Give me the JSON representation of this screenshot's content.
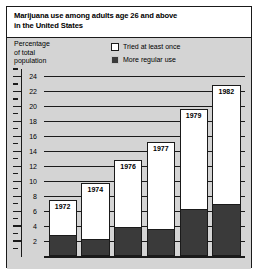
{
  "title": {
    "line1": "Marijuana use among adults age 26 and above",
    "line2": "in the United States"
  },
  "ylabel": {
    "line1": "Percentage",
    "line2": "of total",
    "line3": "population"
  },
  "legend": [
    {
      "label": "Tried at least once",
      "swatch": "open-square-icon",
      "color": "#ffffff"
    },
    {
      "label": "More regular use",
      "swatch": "filled-square-icon",
      "color": "#3a3a3a"
    }
  ],
  "chart_data": {
    "type": "bar",
    "title": "Marijuana use among adults age 26 and above in the United States",
    "xlabel": "",
    "ylabel": "Percentage of total population",
    "ylim": [
      0,
      25
    ],
    "yticks": [
      2,
      4,
      6,
      8,
      10,
      12,
      14,
      16,
      18,
      20,
      22,
      24
    ],
    "minor_tick_step": 1,
    "grid": true,
    "legend_position": "top-right",
    "categories": [
      "1972",
      "1974",
      "1976",
      "1977",
      "1979",
      "1982"
    ],
    "series": [
      {
        "name": "Tried at least once",
        "values": [
          7.5,
          9.8,
          12.8,
          15.2,
          19.6,
          22.8
        ]
      },
      {
        "name": "More regular use",
        "values": [
          2.7,
          2.1,
          3.8,
          3.5,
          6.1,
          6.8
        ]
      }
    ]
  },
  "colors": {
    "panel_background": "#d4d4d4",
    "title_background": "#ffffff",
    "frame": "#1a1a1a",
    "bar_light": "#ffffff",
    "bar_dark": "#3a3a3a"
  }
}
